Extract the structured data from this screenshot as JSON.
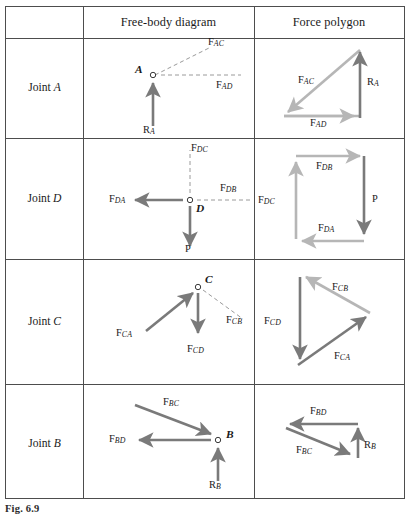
{
  "figure": {
    "caption_label": "Fig.",
    "caption_number": "6.9"
  },
  "table": {
    "headers": {
      "col0": "",
      "col1": "Free-body diagram",
      "col2": "Force  polygon"
    },
    "rows": [
      {
        "joint_prefix": "Joint",
        "joint_id": "A",
        "free_body": {
          "node_label": "A",
          "forces": [
            {
              "name": "F",
              "sub": "AC",
              "style": "dashed",
              "direction": "up-right",
              "sense": "away"
            },
            {
              "name": "F",
              "sub": "AD",
              "style": "dashed",
              "direction": "right",
              "sense": "away"
            },
            {
              "name": "R",
              "sub": "A",
              "style": "solid-dark",
              "direction": "up",
              "sense": "toward"
            }
          ]
        },
        "polygon": {
          "forces": [
            {
              "name": "F",
              "sub": "AC",
              "color": "light",
              "direction": "down-left"
            },
            {
              "name": "F",
              "sub": "AD",
              "color": "light",
              "direction": "right"
            },
            {
              "name": "R",
              "sub": "A",
              "color": "dark",
              "direction": "up"
            }
          ]
        }
      },
      {
        "joint_prefix": "Joint",
        "joint_id": "D",
        "free_body": {
          "node_label": "D",
          "forces": [
            {
              "name": "F",
              "sub": "DC",
              "style": "dashed",
              "direction": "up",
              "sense": "away"
            },
            {
              "name": "F",
              "sub": "DB",
              "style": "dashed",
              "direction": "right",
              "sense": "away"
            },
            {
              "name": "F",
              "sub": "DA",
              "style": "solid-dark",
              "direction": "left",
              "sense": "away"
            },
            {
              "name": "P",
              "sub": "",
              "style": "solid-dark",
              "direction": "down",
              "sense": "away"
            }
          ]
        },
        "polygon": {
          "forces": [
            {
              "name": "F",
              "sub": "DC",
              "color": "light",
              "direction": "up"
            },
            {
              "name": "F",
              "sub": "DB",
              "color": "light",
              "direction": "right"
            },
            {
              "name": "P",
              "sub": "",
              "color": "dark",
              "direction": "down"
            },
            {
              "name": "F",
              "sub": "DA",
              "color": "light",
              "direction": "left"
            }
          ]
        }
      },
      {
        "joint_prefix": "Joint",
        "joint_id": "C",
        "free_body": {
          "node_label": "C",
          "forces": [
            {
              "name": "F",
              "sub": "CA",
              "style": "solid-dark",
              "direction": "up-right",
              "sense": "toward"
            },
            {
              "name": "F",
              "sub": "CD",
              "style": "solid-dark",
              "direction": "down",
              "sense": "away"
            },
            {
              "name": "F",
              "sub": "CB",
              "style": "dashed",
              "direction": "down-right",
              "sense": "away"
            }
          ]
        },
        "polygon": {
          "forces": [
            {
              "name": "F",
              "sub": "CD",
              "color": "dark",
              "direction": "down"
            },
            {
              "name": "F",
              "sub": "CA",
              "color": "dark",
              "direction": "up-right"
            },
            {
              "name": "F",
              "sub": "CB",
              "color": "light",
              "direction": "up-left"
            }
          ]
        }
      },
      {
        "joint_prefix": "Joint",
        "joint_id": "B",
        "free_body": {
          "node_label": "B",
          "forces": [
            {
              "name": "F",
              "sub": "BC",
              "style": "solid-dark",
              "direction": "down-right",
              "sense": "toward"
            },
            {
              "name": "F",
              "sub": "BD",
              "style": "solid-dark",
              "direction": "left",
              "sense": "away"
            },
            {
              "name": "R",
              "sub": "B",
              "style": "solid-dark",
              "direction": "up",
              "sense": "toward"
            }
          ]
        },
        "polygon": {
          "forces": [
            {
              "name": "F",
              "sub": "BD",
              "color": "dark",
              "direction": "left"
            },
            {
              "name": "F",
              "sub": "BC",
              "color": "dark",
              "direction": "down-right"
            },
            {
              "name": "R",
              "sub": "B",
              "color": "dark",
              "direction": "up"
            }
          ]
        }
      }
    ]
  },
  "colors": {
    "arrow_dark": "#7a7a7a",
    "arrow_light": "#b6b6b6",
    "dashed": "#9a9a9a",
    "rule": "#4d4d4d",
    "text": "#1a1a1a"
  }
}
